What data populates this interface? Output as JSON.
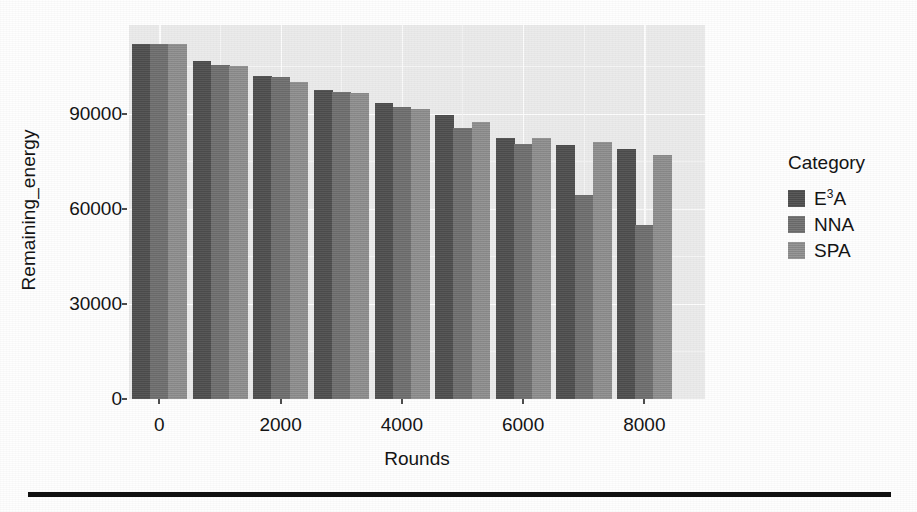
{
  "chart_data": {
    "type": "bar",
    "title": "",
    "subtitle": "",
    "xlabel": "Rounds",
    "ylabel": "Remaining_energy",
    "legend_title": "Category",
    "legend_position": "right",
    "grid": true,
    "grid_color": "#ffffff",
    "panel_background": "#ebebeb",
    "xlim": [
      -500,
      9000
    ],
    "ylim": [
      0,
      118000
    ],
    "x_ticks": [
      0,
      2000,
      4000,
      6000,
      8000
    ],
    "x_tick_labels": [
      "0",
      "2000",
      "4000",
      "6000",
      "8000"
    ],
    "y_ticks": [
      0,
      30000,
      60000,
      90000
    ],
    "y_tick_labels": [
      "0",
      "30000",
      "60000",
      "90000"
    ],
    "categories": [
      0,
      1000,
      2000,
      3000,
      4000,
      5000,
      6000,
      7000,
      8000
    ],
    "category_labels": [
      "0",
      "1000",
      "2000",
      "3000",
      "4000",
      "5000",
      "6000",
      "7000",
      "8000"
    ],
    "series": [
      {
        "name": "E3A",
        "label": "E",
        "label_sup": "3",
        "label_tail": "A",
        "color": "#4f4f4f",
        "values": [
          112000,
          106500,
          102000,
          97500,
          93500,
          89500,
          82500,
          80000,
          79000
        ]
      },
      {
        "name": "NNA",
        "label": "NNA",
        "label_sup": "",
        "label_tail": "",
        "color": "#707070",
        "values": [
          112000,
          105500,
          101500,
          97000,
          92000,
          85500,
          80500,
          64500,
          55000
        ]
      },
      {
        "name": "SPA",
        "label": "SPA",
        "label_sup": "",
        "label_tail": "",
        "color": "#909090",
        "values": [
          112000,
          105000,
          100000,
          96500,
          91500,
          87500,
          82500,
          81000,
          77000
        ]
      }
    ]
  },
  "axes": {
    "y_title": "Remaining_energy",
    "x_title": "Rounds"
  },
  "legend": {
    "title": "Category"
  },
  "decor": {
    "bottom_rule_color": "#101010"
  }
}
